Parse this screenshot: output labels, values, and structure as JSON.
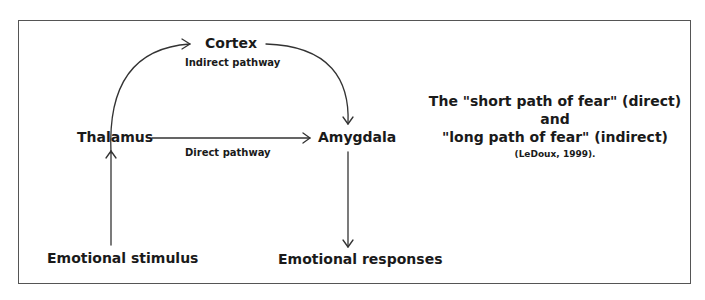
{
  "diagram": {
    "nodes": {
      "cortex": "Cortex",
      "thalamus": "Thalamus",
      "amygdala": "Amygdala",
      "stimulus": "Emotional stimulus",
      "responses": "Emotional responses"
    },
    "edge_labels": {
      "indirect": "Indirect pathway",
      "direct": "Direct pathway"
    },
    "edges": [
      {
        "from": "Emotional stimulus",
        "to": "Thalamus"
      },
      {
        "from": "Thalamus",
        "to": "Cortex"
      },
      {
        "from": "Cortex",
        "to": "Amygdala"
      },
      {
        "from": "Thalamus",
        "to": "Amygdala"
      },
      {
        "from": "Amygdala",
        "to": "Emotional responses"
      }
    ]
  },
  "caption": {
    "line1": "The \"short path of fear\" (direct)",
    "line2": "and",
    "line3": "\"long path of fear\" (indirect)",
    "citation": "(LeDoux, 1999)."
  },
  "colors": {
    "line": "#333333",
    "frame": "#555555",
    "text": "#1a1a1a"
  }
}
